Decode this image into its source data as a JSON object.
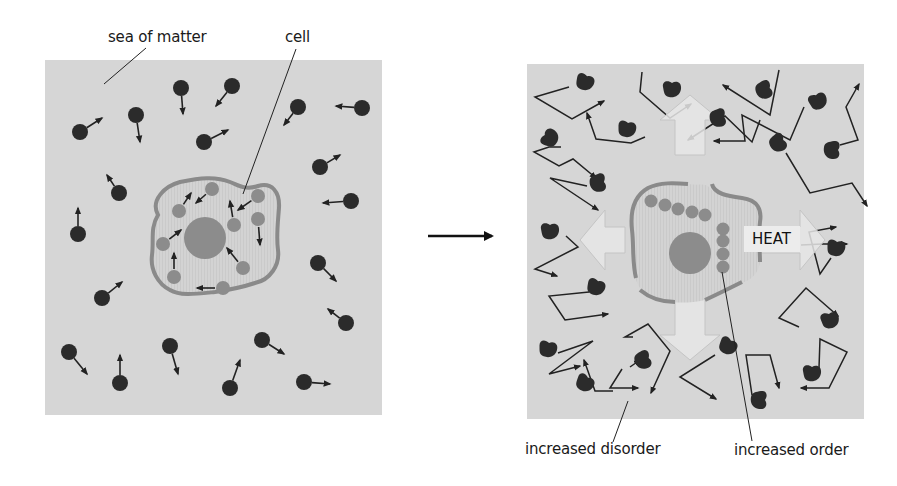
{
  "labels": {
    "sea_of_matter": "sea of matter",
    "cell": "cell",
    "increased_disorder": "increased disorder",
    "increased_order": "increased order",
    "heat": "HEAT"
  },
  "colors": {
    "panel_bg": "#d6d6d6",
    "molecule": "#2b2b2b",
    "organelle": "#8c8c8c",
    "membrane": "#8a8a8a",
    "cytoplasm": "#cfcfcf",
    "heat_arrow_fill": "#e6e6e6",
    "heat_arrow_stroke": "#c4c4c4",
    "line": "#222222"
  },
  "left_panel": {
    "x": 45,
    "y": 60,
    "w": 337,
    "h": 355,
    "molecules": [
      {
        "x": 80,
        "y": 132,
        "dx": 22,
        "dy": -14
      },
      {
        "x": 136,
        "y": 115,
        "dx": 4,
        "dy": 27
      },
      {
        "x": 181,
        "y": 88,
        "dx": 2,
        "dy": 26
      },
      {
        "x": 232,
        "y": 86,
        "dx": -16,
        "dy": 20
      },
      {
        "x": 204,
        "y": 142,
        "dx": 24,
        "dy": -12
      },
      {
        "x": 298,
        "y": 107,
        "dx": -14,
        "dy": 18
      },
      {
        "x": 362,
        "y": 108,
        "dx": -26,
        "dy": -2
      },
      {
        "x": 320,
        "y": 167,
        "dx": 20,
        "dy": -12
      },
      {
        "x": 119,
        "y": 193,
        "dx": -12,
        "dy": -18
      },
      {
        "x": 78,
        "y": 234,
        "dx": 0,
        "dy": -26
      },
      {
        "x": 351,
        "y": 201,
        "dx": -28,
        "dy": 2
      },
      {
        "x": 318,
        "y": 263,
        "dx": 18,
        "dy": 18
      },
      {
        "x": 102,
        "y": 298,
        "dx": 20,
        "dy": -16
      },
      {
        "x": 346,
        "y": 323,
        "dx": -18,
        "dy": -14
      },
      {
        "x": 69,
        "y": 352,
        "dx": 18,
        "dy": 22
      },
      {
        "x": 120,
        "y": 383,
        "dx": 0,
        "dy": -28
      },
      {
        "x": 170,
        "y": 346,
        "dx": 8,
        "dy": 28
      },
      {
        "x": 262,
        "y": 340,
        "dx": 22,
        "dy": 14
      },
      {
        "x": 230,
        "y": 388,
        "dx": 10,
        "dy": -28
      },
      {
        "x": 304,
        "y": 382,
        "dx": 26,
        "dy": 2
      }
    ],
    "cell": {
      "membrane_path": "M158,215 C150,200 165,186 180,182 C200,178 215,176 230,182 C240,186 245,190 258,186 C272,182 280,192 279,208 C278,222 276,236 278,250 C280,265 270,280 255,283 C240,288 228,290 215,292 C195,294 180,296 170,290 C158,284 150,270 152,255 C154,240 150,228 158,215 Z",
      "nucleus": {
        "x": 205,
        "y": 238,
        "r": 21
      },
      "organelles": [
        {
          "x": 179,
          "y": 211,
          "dx": 12,
          "dy": -18
        },
        {
          "x": 212,
          "y": 189,
          "dx": -16,
          "dy": 14
        },
        {
          "x": 258,
          "y": 196,
          "dx": -20,
          "dy": 14
        },
        {
          "x": 234,
          "y": 225,
          "dx": -4,
          "dy": -24
        },
        {
          "x": 258,
          "y": 219,
          "dx": 2,
          "dy": 26
        },
        {
          "x": 163,
          "y": 244,
          "dx": 18,
          "dy": -14
        },
        {
          "x": 174,
          "y": 277,
          "dx": 0,
          "dy": -24
        },
        {
          "x": 243,
          "y": 268,
          "dx": -16,
          "dy": -20
        },
        {
          "x": 223,
          "y": 288,
          "dx": -26,
          "dy": 0
        }
      ]
    }
  },
  "transition_arrow": {
    "x1": 428,
    "y1": 236,
    "x2": 492,
    "y2": 236
  },
  "right_panel": {
    "x": 527,
    "y": 64,
    "w": 337,
    "h": 355,
    "heat_cross": {
      "cx": 690,
      "cy": 240
    },
    "cell": {
      "nucleus": {
        "x": 690,
        "y": 253,
        "r": 21
      },
      "chain_horizontal": [
        {
          "x": 651,
          "y": 201
        },
        {
          "x": 665,
          "y": 205
        },
        {
          "x": 678,
          "y": 209
        },
        {
          "x": 692,
          "y": 212
        },
        {
          "x": 705,
          "y": 215
        }
      ],
      "chain_vertical": [
        {
          "x": 723,
          "y": 229
        },
        {
          "x": 723,
          "y": 241
        },
        {
          "x": 723,
          "y": 254
        },
        {
          "x": 723,
          "y": 267
        }
      ]
    },
    "molecules": [
      {
        "x": 585,
        "y": 82,
        "rot": 20
      },
      {
        "x": 672,
        "y": 89,
        "rot": 0
      },
      {
        "x": 764,
        "y": 90,
        "rot": 70
      },
      {
        "x": 818,
        "y": 101,
        "rot": -20
      },
      {
        "x": 550,
        "y": 138,
        "rot": -60
      },
      {
        "x": 627,
        "y": 129,
        "rot": 10
      },
      {
        "x": 718,
        "y": 118,
        "rot": 80
      },
      {
        "x": 778,
        "y": 143,
        "rot": 60
      },
      {
        "x": 832,
        "y": 150,
        "rot": 90
      },
      {
        "x": 598,
        "y": 183,
        "rot": 80
      },
      {
        "x": 550,
        "y": 231,
        "rot": 0
      },
      {
        "x": 836,
        "y": 248,
        "rot": 10
      },
      {
        "x": 596,
        "y": 287,
        "rot": 20
      },
      {
        "x": 830,
        "y": 320,
        "rot": -10
      },
      {
        "x": 548,
        "y": 349,
        "rot": 10
      },
      {
        "x": 643,
        "y": 360,
        "rot": 70
      },
      {
        "x": 585,
        "y": 383,
        "rot": 30
      },
      {
        "x": 728,
        "y": 346,
        "rot": 30
      },
      {
        "x": 812,
        "y": 373,
        "rot": 0
      },
      {
        "x": 759,
        "y": 400,
        "rot": 90
      }
    ],
    "paths": [
      "M569,87 L535,97 L572,119 L604,101",
      "M642,72 L640,92 L670,118 L691,104",
      "M779,70 L770,115 L723,85",
      "M760,120 L752,142 L725,116 L688,140",
      "M804,107 L790,140 L742,115 L745,141 L714,141",
      "M840,145 L858,140 L846,107 L859,84",
      "M561,147 L549,147 L534,152 L559,166 L573,159 L596,178",
      "M645,137 L631,143 L596,139 L587,113",
      "M587,186 L550,178 L598,210",
      "M786,153 L810,193 L852,183 L867,206",
      "M566,236 L578,247 L535,269 L557,276",
      "M831,258 L820,274 L809,232 L836,227",
      "M801,245 L822,244 L847,244",
      "M589,292 L549,296 L565,320 L608,314",
      "M799,327 L779,318 L806,288 L838,316",
      "M558,353 L593,341 L549,374 L580,366",
      "M633,337 L625,337 L648,324 L670,351 L651,393",
      "M622,369 L610,388 L638,388",
      "M613,391 L595,391 L584,360",
      "M715,355 L680,377 L716,399",
      "M752,395 L746,355 L770,355 L779,388",
      "M819,368 L820,339 L847,352 L829,388 L801,388",
      "M630,367 L640,360"
    ]
  },
  "leaders": {
    "sea_of_matter": {
      "x1": 146,
      "y1": 48,
      "x2": 104,
      "y2": 84
    },
    "cell": {
      "x1": 296,
      "y1": 49,
      "x2": 243,
      "y2": 194
    },
    "increased_disorder": {
      "x1": 628,
      "y1": 401,
      "x2": 613,
      "y2": 442
    },
    "increased_order": {
      "x1": 722,
      "y1": 272,
      "x2": 752,
      "y2": 441
    }
  }
}
